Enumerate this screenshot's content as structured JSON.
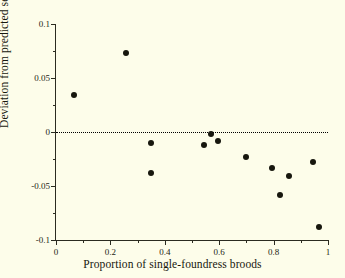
{
  "chart_data": {
    "type": "scatter",
    "title": "",
    "xlabel": "Proportion of single-foundress broods",
    "ylabel": "Deviation from predicted sex ratio",
    "xlim": [
      0,
      1
    ],
    "ylim": [
      -0.1,
      0.1
    ],
    "grid": false,
    "legend": null,
    "annotations": [
      {
        "type": "hline",
        "y": 0,
        "style": "dotted",
        "color": "#000000"
      }
    ],
    "xticks": [
      0,
      0.2,
      0.4,
      0.6,
      0.8,
      1
    ],
    "xtick_labels": [
      "0",
      "0.2",
      "0.4",
      "0.6",
      "0.8",
      "1"
    ],
    "xticks_minor": [
      0.1,
      0.3,
      0.5,
      0.7,
      0.9
    ],
    "yticks": [
      -0.1,
      -0.05,
      0,
      0.05,
      0.1
    ],
    "ytick_labels": [
      "-0.1",
      "-0.05",
      "0",
      "0.05",
      "0.1"
    ],
    "yticks_minor": [
      -0.075,
      -0.025,
      0.025,
      0.075
    ],
    "marker": "filled-circle",
    "marker_color": "#17170e",
    "points": [
      {
        "x": 0.066,
        "y": 0.034
      },
      {
        "x": 0.257,
        "y": 0.073
      },
      {
        "x": 0.35,
        "y": -0.01
      },
      {
        "x": 0.348,
        "y": -0.038
      },
      {
        "x": 0.543,
        "y": -0.012
      },
      {
        "x": 0.57,
        "y": -0.002
      },
      {
        "x": 0.596,
        "y": -0.008
      },
      {
        "x": 0.698,
        "y": -0.023
      },
      {
        "x": 0.793,
        "y": -0.033
      },
      {
        "x": 0.823,
        "y": -0.058
      },
      {
        "x": 0.855,
        "y": -0.041
      },
      {
        "x": 0.944,
        "y": -0.028
      },
      {
        "x": 0.966,
        "y": -0.088
      }
    ]
  }
}
